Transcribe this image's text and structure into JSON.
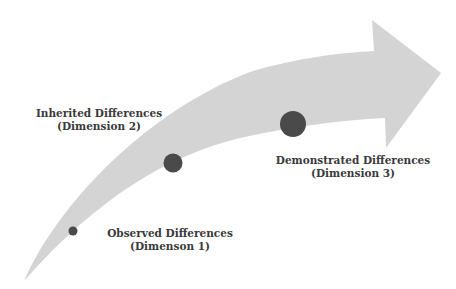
{
  "diagram": {
    "type": "curved-arrow-progression",
    "colors": {
      "arrow_fill": "#d4d4d4",
      "dot_fill": "#4a4a4a",
      "text": "#3a3a3a",
      "background": "#ffffff"
    },
    "stages": [
      {
        "title": "Observed Differences",
        "subtitle": "(Dimenson 1)",
        "dot": {
          "cx": 73,
          "cy": 231,
          "r": 4.5
        }
      },
      {
        "title": "Inherited Differences",
        "subtitle": "(Dimension 2)",
        "dot": {
          "cx": 173,
          "cy": 163,
          "r": 9.5
        }
      },
      {
        "title": "Demonstrated Differences",
        "subtitle": "(Dimension 3)",
        "dot": {
          "cx": 293,
          "cy": 124,
          "r": 13
        }
      }
    ]
  }
}
